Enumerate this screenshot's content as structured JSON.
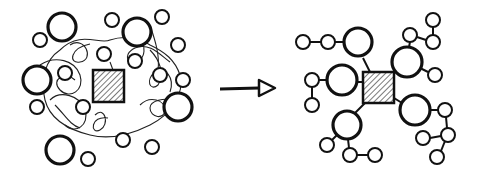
{
  "diagram": {
    "type": "before-after concept diagram",
    "colors": {
      "ink": "#111111",
      "background": "#ffffff"
    },
    "before": {
      "label": "chaotic cluster",
      "hub": {
        "shape": "hatched-square",
        "x": 93,
        "y": 70,
        "w": 31,
        "h": 32
      },
      "nodes": [
        {
          "cx": 62,
          "cy": 27,
          "r": 14,
          "w": 3.2
        },
        {
          "cx": 40,
          "cy": 40,
          "r": 7,
          "w": 2
        },
        {
          "cx": 112,
          "cy": 20,
          "r": 7,
          "w": 2
        },
        {
          "cx": 137,
          "cy": 32,
          "r": 14,
          "w": 3.2
        },
        {
          "cx": 162,
          "cy": 17,
          "r": 7,
          "w": 2
        },
        {
          "cx": 178,
          "cy": 45,
          "r": 7,
          "w": 2
        },
        {
          "cx": 104,
          "cy": 54,
          "r": 7,
          "w": 2
        },
        {
          "cx": 135,
          "cy": 61,
          "r": 7,
          "w": 2
        },
        {
          "cx": 37,
          "cy": 80,
          "r": 14,
          "w": 3.2
        },
        {
          "cx": 65,
          "cy": 73,
          "r": 7,
          "w": 2
        },
        {
          "cx": 160,
          "cy": 75,
          "r": 7,
          "w": 2
        },
        {
          "cx": 183,
          "cy": 80,
          "r": 7,
          "w": 2
        },
        {
          "cx": 37,
          "cy": 107,
          "r": 7,
          "w": 2
        },
        {
          "cx": 83,
          "cy": 107,
          "r": 7,
          "w": 2
        },
        {
          "cx": 178,
          "cy": 107,
          "r": 14,
          "w": 3.2
        },
        {
          "cx": 123,
          "cy": 140,
          "r": 7,
          "w": 2
        },
        {
          "cx": 152,
          "cy": 147,
          "r": 7,
          "w": 2
        },
        {
          "cx": 60,
          "cy": 150,
          "r": 14,
          "w": 3.2
        },
        {
          "cx": 88,
          "cy": 159,
          "r": 7,
          "w": 2
        }
      ],
      "tangled_lines": true
    },
    "arrow": {
      "direction": "right",
      "from": [
        220,
        89
      ],
      "to": [
        275,
        89
      ]
    },
    "after": {
      "label": "organized hub and spoke",
      "hub": {
        "shape": "hatched-square",
        "x": 363,
        "y": 72,
        "w": 31,
        "h": 31
      },
      "branches": [
        {
          "big": {
            "cx": 358,
            "cy": 42,
            "r": 14
          },
          "children": [
            [
              328,
              42
            ],
            [
              303,
              42
            ]
          ],
          "links": [
            [
              344,
              42,
              335,
              42
            ],
            [
              321,
              42,
              310,
              42
            ]
          ],
          "hub_link": [
            363,
            58,
            370,
            72
          ]
        },
        {
          "big": {
            "cx": 342,
            "cy": 80,
            "r": 15
          },
          "children": [
            [
              312,
              80
            ],
            [
              312,
              105
            ]
          ],
          "links": [
            [
              327,
              80,
              319,
              80
            ],
            [
              312,
              87,
              312,
              98
            ]
          ],
          "hub_link": [
            357,
            82,
            363,
            82
          ]
        },
        {
          "big": {
            "cx": 407,
            "cy": 62,
            "r": 15
          },
          "children": [
            [
              410,
              35
            ],
            [
              433,
              42
            ],
            [
              433,
              20
            ],
            [
              435,
              75
            ]
          ],
          "links": [
            [
              409,
              47,
              410,
              42
            ],
            [
              417,
              37,
              426,
              40
            ],
            [
              433,
              35,
              433,
              27
            ],
            [
              420,
              68,
              428,
              72
            ]
          ],
          "hub_link": [
            394,
            72,
            396,
            72
          ]
        },
        {
          "big": {
            "cx": 347,
            "cy": 125,
            "r": 14
          },
          "children": [
            [
              327,
              145
            ],
            [
              350,
              155
            ],
            [
              375,
              155
            ]
          ],
          "links": [
            [
              337,
              135,
              332,
              140
            ],
            [
              348,
              139,
              349,
              148
            ],
            [
              357,
              155,
              368,
              155
            ]
          ],
          "hub_link": [
            355,
            113,
            365,
            103
          ]
        },
        {
          "big": {
            "cx": 415,
            "cy": 110,
            "r": 15
          },
          "children": [
            [
              445,
              110
            ],
            [
              448,
              135
            ],
            [
              423,
              138
            ],
            [
              437,
              157
            ]
          ],
          "links": [
            [
              430,
              110,
              438,
              110
            ],
            [
              446,
              117,
              447,
              128
            ],
            [
              441,
              136,
              430,
              138
            ],
            [
              445,
              141,
              441,
              151
            ]
          ],
          "hub_link": [
            394,
            98,
            402,
            103
          ]
        }
      ]
    }
  }
}
